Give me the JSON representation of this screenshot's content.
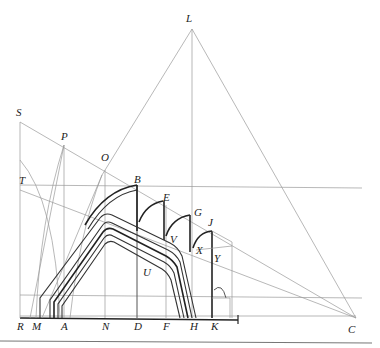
{
  "figure": {
    "points": [
      {
        "id": "L",
        "label": "L",
        "x": 192,
        "y": 22
      },
      {
        "id": "S",
        "label": "S",
        "x": 20,
        "y": 115
      },
      {
        "id": "P",
        "label": "P",
        "x": 64,
        "y": 140
      },
      {
        "id": "O",
        "label": "O",
        "x": 102,
        "y": 161
      },
      {
        "id": "T",
        "label": "T",
        "x": 20,
        "y": 184
      },
      {
        "id": "B",
        "label": "B",
        "x": 137,
        "y": 185
      },
      {
        "id": "E",
        "label": "E",
        "x": 163,
        "y": 201
      },
      {
        "id": "G",
        "label": "G",
        "x": 196,
        "y": 215
      },
      {
        "id": "J",
        "label": "J",
        "x": 210,
        "y": 226
      },
      {
        "id": "V",
        "label": "V",
        "x": 170,
        "y": 241
      },
      {
        "id": "X",
        "label": "X",
        "x": 197,
        "y": 252
      },
      {
        "id": "Y",
        "label": "Y",
        "x": 214,
        "y": 261
      },
      {
        "id": "U",
        "label": "U",
        "x": 143,
        "y": 275
      },
      {
        "id": "R",
        "label": "R",
        "x": 20,
        "y": 326
      },
      {
        "id": "M",
        "label": "M",
        "x": 37,
        "y": 326
      },
      {
        "id": "A",
        "label": "A",
        "x": 64,
        "y": 326
      },
      {
        "id": "N",
        "label": "N",
        "x": 105,
        "y": 326
      },
      {
        "id": "D",
        "label": "D",
        "x": 137,
        "y": 326
      },
      {
        "id": "F",
        "label": "F",
        "x": 166,
        "y": 326
      },
      {
        "id": "H",
        "label": "H",
        "x": 193,
        "y": 326
      },
      {
        "id": "K",
        "label": "K",
        "x": 215,
        "y": 326
      },
      {
        "id": "C",
        "label": "C",
        "x": 351,
        "y": 329
      }
    ]
  }
}
